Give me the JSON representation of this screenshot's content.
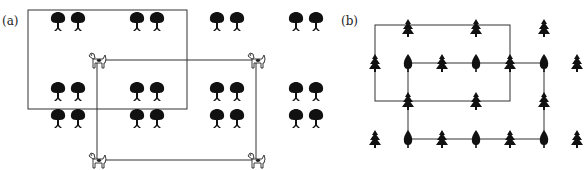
{
  "panel_a": {
    "label": "(a)",
    "tree_icon": "round-tree-icon",
    "dog_icon": "dog-icon",
    "tree_columns": [
      58,
      78,
      137,
      157,
      217,
      237,
      296,
      316
    ],
    "tree_rows": [
      22,
      92,
      119
    ],
    "rect_trees": {
      "x1": 28,
      "y1": 10,
      "x2": 187,
      "y2": 109
    },
    "dogs": [
      [
        97,
        60
      ],
      [
        256,
        60
      ],
      [
        97,
        160
      ],
      [
        256,
        160
      ]
    ]
  },
  "panel_b": {
    "label": "(b)",
    "pine_icon": "pine-tree-icon",
    "round_icon": "cypress-tree-icon",
    "trees": [
      {
        "x": 408,
        "y": 28,
        "type": "pine"
      },
      {
        "x": 476,
        "y": 28,
        "type": "pine"
      },
      {
        "x": 544,
        "y": 28,
        "type": "pine"
      },
      {
        "x": 375,
        "y": 63,
        "type": "pine"
      },
      {
        "x": 408,
        "y": 63,
        "type": "round"
      },
      {
        "x": 442,
        "y": 63,
        "type": "pine"
      },
      {
        "x": 476,
        "y": 63,
        "type": "round"
      },
      {
        "x": 510,
        "y": 63,
        "type": "pine"
      },
      {
        "x": 544,
        "y": 63,
        "type": "round"
      },
      {
        "x": 577,
        "y": 63,
        "type": "pine"
      },
      {
        "x": 408,
        "y": 101,
        "type": "pine"
      },
      {
        "x": 476,
        "y": 101,
        "type": "pine"
      },
      {
        "x": 544,
        "y": 101,
        "type": "pine"
      },
      {
        "x": 375,
        "y": 139,
        "type": "pine"
      },
      {
        "x": 408,
        "y": 139,
        "type": "round"
      },
      {
        "x": 442,
        "y": 139,
        "type": "pine"
      },
      {
        "x": 476,
        "y": 139,
        "type": "round"
      },
      {
        "x": 510,
        "y": 139,
        "type": "pine"
      },
      {
        "x": 544,
        "y": 139,
        "type": "round"
      },
      {
        "x": 577,
        "y": 139,
        "type": "pine"
      }
    ],
    "rect_outer": {
      "x1": 375,
      "y1": 25,
      "x2": 510,
      "y2": 101
    },
    "rect_inner": {
      "x1": 408,
      "y1": 63,
      "x2": 544,
      "y2": 139
    }
  }
}
